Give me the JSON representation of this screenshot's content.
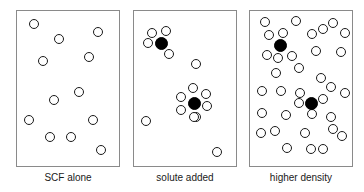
{
  "figure": {
    "width": 364,
    "height": 192,
    "background_color": "#ffffff",
    "solvent_color": "#ffffff",
    "solvent_outline_color": "#1a1a1a",
    "solute_color": "#000000",
    "panel_border_color": "#8a8a8a",
    "caption_color": "#1a1a1a",
    "solvent_radius": 5,
    "solute_radius": 6.5
  },
  "panels": [
    {
      "id": "panel-scf-alone",
      "caption": "SCF alone",
      "box": {
        "x": 16,
        "y": 10,
        "w": 104,
        "h": 157
      },
      "solute_count": 0,
      "solvent_count": 12,
      "solutes": [],
      "solvents": [
        {
          "x": 34,
          "y": 24
        },
        {
          "x": 59,
          "y": 39
        },
        {
          "x": 98,
          "y": 32
        },
        {
          "x": 43,
          "y": 61
        },
        {
          "x": 89,
          "y": 57
        },
        {
          "x": 79,
          "y": 92
        },
        {
          "x": 54,
          "y": 100
        },
        {
          "x": 29,
          "y": 120
        },
        {
          "x": 93,
          "y": 120
        },
        {
          "x": 50,
          "y": 137
        },
        {
          "x": 71,
          "y": 137
        },
        {
          "x": 101,
          "y": 150
        }
      ]
    },
    {
      "id": "panel-solute-added",
      "caption": "solute added",
      "box": {
        "x": 133,
        "y": 10,
        "w": 104,
        "h": 157
      },
      "solute_count": 2,
      "solvent_count": 14,
      "solutes": [
        {
          "x": 161,
          "y": 43
        },
        {
          "x": 194,
          "y": 103
        }
      ],
      "solvents": [
        {
          "x": 152,
          "y": 33
        },
        {
          "x": 166,
          "y": 31
        },
        {
          "x": 148,
          "y": 43
        },
        {
          "x": 169,
          "y": 54
        },
        {
          "x": 196,
          "y": 64
        },
        {
          "x": 146,
          "y": 121
        },
        {
          "x": 196,
          "y": 117
        },
        {
          "x": 217,
          "y": 152
        },
        {
          "x": 193,
          "y": 88
        },
        {
          "x": 181,
          "y": 97
        },
        {
          "x": 181,
          "y": 110
        },
        {
          "x": 194,
          "y": 117
        },
        {
          "x": 207,
          "y": 106
        },
        {
          "x": 206,
          "y": 94
        }
      ]
    },
    {
      "id": "panel-higher-density",
      "caption": "higher density",
      "box": {
        "x": 249,
        "y": 10,
        "w": 104,
        "h": 157
      },
      "solute_count": 2,
      "solvent_count": 33,
      "solutes": [
        {
          "x": 280,
          "y": 45
        },
        {
          "x": 311,
          "y": 103
        }
      ],
      "solvents": [
        {
          "x": 265,
          "y": 22
        },
        {
          "x": 296,
          "y": 21
        },
        {
          "x": 333,
          "y": 23
        },
        {
          "x": 269,
          "y": 35
        },
        {
          "x": 283,
          "y": 33
        },
        {
          "x": 312,
          "y": 34
        },
        {
          "x": 323,
          "y": 29
        },
        {
          "x": 345,
          "y": 33
        },
        {
          "x": 267,
          "y": 55
        },
        {
          "x": 292,
          "y": 56
        },
        {
          "x": 316,
          "y": 51
        },
        {
          "x": 341,
          "y": 52
        },
        {
          "x": 278,
          "y": 58
        },
        {
          "x": 299,
          "y": 68
        },
        {
          "x": 276,
          "y": 73
        },
        {
          "x": 321,
          "y": 78
        },
        {
          "x": 331,
          "y": 87
        },
        {
          "x": 262,
          "y": 91
        },
        {
          "x": 281,
          "y": 91
        },
        {
          "x": 300,
          "y": 93
        },
        {
          "x": 299,
          "y": 103
        },
        {
          "x": 323,
          "y": 99
        },
        {
          "x": 312,
          "y": 114
        },
        {
          "x": 345,
          "y": 93
        },
        {
          "x": 262,
          "y": 113
        },
        {
          "x": 286,
          "y": 115
        },
        {
          "x": 331,
          "y": 117
        },
        {
          "x": 261,
          "y": 133
        },
        {
          "x": 275,
          "y": 131
        },
        {
          "x": 305,
          "y": 133
        },
        {
          "x": 333,
          "y": 129
        },
        {
          "x": 342,
          "y": 136
        },
        {
          "x": 287,
          "y": 148
        },
        {
          "x": 311,
          "y": 149
        },
        {
          "x": 323,
          "y": 149
        }
      ]
    }
  ],
  "captions": {
    "left": "SCF alone",
    "middle": "solute added",
    "right": "higher density",
    "y": 172
  }
}
